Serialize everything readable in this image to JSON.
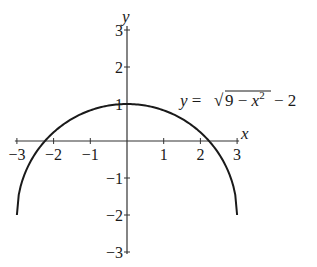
{
  "chart_data": {
    "type": "line",
    "title": "",
    "xlabel": "x",
    "ylabel": "y",
    "xlim": [
      -3,
      3
    ],
    "ylim": [
      -3,
      3
    ],
    "grid": false,
    "x_ticks": [
      -3,
      -2,
      -1,
      1,
      2,
      3
    ],
    "y_ticks": [
      3,
      2,
      1,
      -1,
      -2,
      -3
    ],
    "x_tick_labels": [
      "−3",
      "−2",
      "−1",
      "1",
      "2",
      "3"
    ],
    "y_tick_labels": [
      "3",
      "2",
      "1",
      "−1",
      "−2",
      "−3"
    ],
    "series": [
      {
        "name": "y = √(9 − x²) − 2",
        "equation": "y = sqrt(9 - x^2) - 2",
        "domain": [
          -3,
          3
        ],
        "x": [
          -3,
          -2.5,
          -2.236,
          -2,
          -1.5,
          -1,
          -0.5,
          0,
          0.5,
          1,
          1.5,
          2,
          2.236,
          2.5,
          3
        ],
        "y": [
          -2,
          -0.342,
          0,
          0.236,
          0.598,
          0.828,
          0.958,
          1,
          0.958,
          0.828,
          0.598,
          0.236,
          0,
          -0.342,
          -2
        ]
      }
    ],
    "annotations": [
      {
        "text": "y = √(9 − x²) − 2",
        "position": "upper right, near (2.5, 1)"
      }
    ],
    "key_points": {
      "maximum": [
        0,
        1
      ],
      "x_intercepts": [
        -2.236,
        2.236
      ],
      "endpoints": [
        [
          -3,
          -2
        ],
        [
          3,
          -2
        ]
      ]
    }
  },
  "labels": {
    "x_axis": "x",
    "y_axis": "y",
    "equation_lhs": "y = ",
    "equation_radicand_9": "9 − ",
    "equation_var": "x",
    "equation_exp": "2",
    "equation_tail": " − 2"
  },
  "colors": {
    "curve": "#1a1a1a",
    "axes": "#333333",
    "background": "#ffffff"
  }
}
